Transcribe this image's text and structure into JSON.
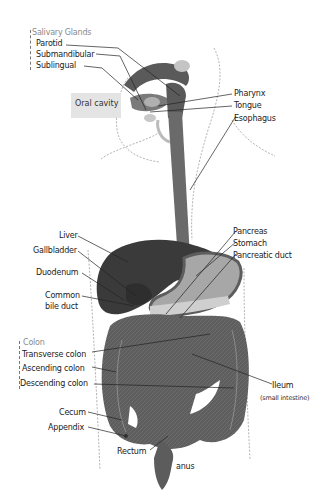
{
  "diagram": {
    "colors": {
      "organ_dark": "#3c3c3c",
      "organ_mid": "#6e6e6e",
      "organ_light": "#a9a9a9",
      "organ_pale": "#cfcfcf",
      "outline": "#999999",
      "leader": "#222222",
      "label_group": "#8a8a8a",
      "oral_box": "#e4e4e4"
    },
    "groups": {
      "salivary": {
        "heading": "Salivary Glands",
        "items": [
          "Parotid",
          "Submandibular",
          "Sublingual"
        ]
      },
      "colon": {
        "heading": "Colon",
        "items": [
          "Transverse colon",
          "Ascending colon",
          "Descending colon"
        ]
      }
    },
    "labels": {
      "oral_cavity": "Oral cavity",
      "pharynx": "Pharynx",
      "tongue": "Tongue",
      "esophagus": "Esophagus",
      "liver": "Liver",
      "gallbladder": "Gallbladder",
      "duodenum": "Duodenum",
      "common_bile_duct_1": "Common",
      "common_bile_duct_2": "bile duct",
      "pancreas": "Pancreas",
      "stomach": "Stomach",
      "pancreatic_duct": "Pancreatic duct",
      "ileum": "Ileum",
      "ileum_sub": "(small intestine)",
      "cecum": "Cecum",
      "appendix": "Appendix",
      "rectum": "Rectum",
      "anus": "anus"
    }
  }
}
